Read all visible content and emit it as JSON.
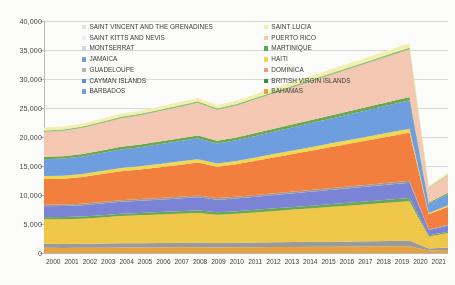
{
  "chart_data": {
    "type": "area",
    "stacked": true,
    "title": "",
    "xlabel": "",
    "ylabel": "",
    "ylim": [
      0,
      40000
    ],
    "ytick_step": 5000,
    "ytick_labels": [
      "40,000",
      "35,000",
      "30,000",
      "25,000",
      "20,000",
      "15,000",
      "10,000",
      "5,000",
      "0"
    ],
    "ytick_values": [
      40000,
      35000,
      30000,
      25000,
      20000,
      15000,
      10000,
      5000,
      0
    ],
    "grid": true,
    "legend_position": "inside-top-left",
    "categories": [
      "2000",
      "2001",
      "2002",
      "2003",
      "2004",
      "2005",
      "2006",
      "2007",
      "2008",
      "2009",
      "2010",
      "2011",
      "2012",
      "2013",
      "2014",
      "2015",
      "2016",
      "2017",
      "2018",
      "2019",
      "2020",
      "2021"
    ],
    "series": [
      {
        "name": "BAHAMAS",
        "color": "#e8a33d",
        "values": [
          900,
          880,
          900,
          920,
          940,
          950,
          960,
          980,
          1000,
          950,
          980,
          1000,
          1020,
          1040,
          1060,
          1080,
          1100,
          1120,
          1150,
          1180,
          420,
          520
        ]
      },
      {
        "name": "BRITISH VIRGIN ISLANDS",
        "color": "#9b9b9b",
        "values": [
          700,
          690,
          700,
          710,
          730,
          740,
          760,
          780,
          800,
          760,
          780,
          800,
          820,
          840,
          860,
          880,
          900,
          920,
          940,
          960,
          340,
          420
        ]
      },
      {
        "name": "DOMINICA",
        "color": "#f0c84a",
        "values": [
          4200,
          4250,
          4300,
          4500,
          4700,
          4800,
          4900,
          5000,
          5100,
          4900,
          5000,
          5200,
          5400,
          5600,
          5800,
          6000,
          6200,
          6400,
          6600,
          6800,
          2100,
          2500
        ]
      },
      {
        "name": "HAITI",
        "color": "#6aa84f",
        "values": [
          380,
          380,
          390,
          400,
          410,
          420,
          430,
          440,
          450,
          430,
          440,
          450,
          460,
          470,
          480,
          490,
          500,
          510,
          520,
          530,
          190,
          230
        ]
      },
      {
        "name": "CAYMAN ISLANDS",
        "color": "#7b84d6",
        "values": [
          1900,
          1900,
          1950,
          2000,
          2050,
          2100,
          2150,
          2200,
          2250,
          2150,
          2200,
          2250,
          2300,
          2350,
          2400,
          2450,
          2500,
          2550,
          2600,
          2650,
          900,
          1050
        ]
      },
      {
        "name": "GUADELOUPE",
        "color": "#9b9b9b",
        "values": [
          260,
          260,
          265,
          270,
          275,
          280,
          285,
          290,
          295,
          285,
          290,
          295,
          300,
          305,
          310,
          315,
          320,
          325,
          330,
          335,
          120,
          140
        ]
      },
      {
        "name": "JAMAICA",
        "color": "#f48040",
        "values": [
          4400,
          4450,
          4600,
          4800,
          5000,
          5100,
          5300,
          5500,
          5700,
          5400,
          5600,
          5900,
          6200,
          6500,
          6800,
          7100,
          7400,
          7700,
          8000,
          8300,
          2600,
          3100
        ]
      },
      {
        "name": "MONTSERRAT",
        "color": "#f2d94e",
        "values": [
          520,
          520,
          530,
          540,
          550,
          560,
          570,
          580,
          590,
          570,
          580,
          590,
          600,
          610,
          620,
          630,
          640,
          650,
          660,
          670,
          240,
          290
        ]
      },
      {
        "name": "SAINT KITTS AND NEVIS",
        "color": "#6f9fe0",
        "values": [
          2900,
          2950,
          3000,
          3100,
          3200,
          3300,
          3400,
          3500,
          3600,
          3450,
          3550,
          3700,
          3850,
          4000,
          4150,
          4300,
          4450,
          4600,
          4750,
          4900,
          1600,
          1900
        ]
      },
      {
        "name": "SAINT VINCENT AND THE GRENADINES",
        "color": "#6aa84f",
        "values": [
          420,
          420,
          430,
          440,
          450,
          460,
          470,
          480,
          490,
          470,
          480,
          490,
          500,
          510,
          520,
          530,
          540,
          550,
          560,
          570,
          200,
          240
        ]
      },
      {
        "name": "PUERTO RICO",
        "color": "#f6c9b4",
        "values": [
          4300,
          4350,
          4500,
          4700,
          4900,
          5000,
          5200,
          5400,
          5600,
          5300,
          5500,
          5800,
          6100,
          6400,
          6700,
          7000,
          7300,
          7600,
          7900,
          8200,
          2500,
          3000
        ]
      },
      {
        "name": "MARTINIQUE",
        "color": "#93c47d",
        "values": [
          260,
          260,
          265,
          270,
          275,
          280,
          285,
          290,
          295,
          285,
          290,
          295,
          300,
          305,
          310,
          315,
          320,
          325,
          330,
          335,
          120,
          145
        ]
      },
      {
        "name": "SAINT LUCIA",
        "color": "#f5efb0",
        "values": [
          480,
          480,
          490,
          500,
          520,
          530,
          545,
          560,
          575,
          555,
          570,
          590,
          610,
          630,
          650,
          670,
          690,
          710,
          730,
          750,
          270,
          330
        ]
      }
    ],
    "annotations": {
      "drop_note": "sharp decline 2019 to 2020"
    }
  },
  "legend": {
    "columns": [
      {
        "items": [
          {
            "label": "SAINT VINCENT AND THE GRENADINES",
            "color": "#dfe6d2"
          },
          {
            "label": "SAINT KITTS AND NEVIS",
            "color": "#eef0ef"
          },
          {
            "label": "MONTSERRAT",
            "color": "#cfd8e6"
          },
          {
            "label": "JAMAICA",
            "color": "#6f9fe0"
          },
          {
            "label": "GUADELOUPE",
            "color": "#b4b4b4"
          },
          {
            "label": "CAYMAN ISLANDS",
            "color": "#5b8fd4"
          },
          {
            "label": "BARBADOS",
            "color": "#6f9fe0"
          }
        ]
      },
      {
        "items": [
          {
            "label": "SAINT LUCIA",
            "color": "#f5efb0"
          },
          {
            "label": "PUERTO RICO",
            "color": "#f6c9b4"
          },
          {
            "label": "MARTINIQUE",
            "color": "#5aa84f"
          },
          {
            "label": "HAITI",
            "color": "#f2d94e"
          },
          {
            "label": "DOMINICA",
            "color": "#ef9b7a"
          },
          {
            "label": "BRITISH VIRGIN ISLANDS",
            "color": "#3d8b3d"
          },
          {
            "label": "BAHAMAS",
            "color": "#e8a33d"
          }
        ]
      }
    ]
  }
}
